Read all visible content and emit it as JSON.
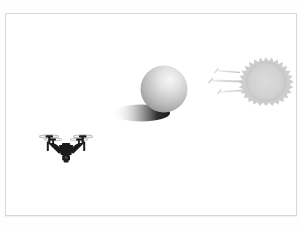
{
  "figure": {
    "title": "",
    "background_color": "#ffffff",
    "frame_color": "#d8d8d8",
    "width": 302,
    "height": 228
  },
  "scene": {
    "description": "Illustration of a quadcopter drone flying near a large sphere that casts a shadow, illuminated by a stylized sun emitting light rays from the right.",
    "objects": [
      {
        "name": "sun",
        "label": "sun",
        "shape": "spiked-circle",
        "color": "#d2d2d2",
        "edge_color": "#c6c6c6",
        "center_x": 266,
        "center_y": 79,
        "radius": 19,
        "spike_count": 22
      },
      {
        "name": "light-rays",
        "label": "light rays",
        "color": "#d0d0d0",
        "count": 3,
        "direction": "right-to-left",
        "rays": [
          {
            "x1": 236,
            "y1": 73,
            "x2": 214,
            "y2": 71
          },
          {
            "x1": 233,
            "y1": 82,
            "x2": 209,
            "y2": 81
          },
          {
            "x1": 237,
            "y1": 90,
            "x2": 217,
            "y2": 91
          }
        ]
      },
      {
        "name": "sphere",
        "label": "sphere",
        "shape": "circle",
        "center_x": 164,
        "center_y": 89,
        "radius": 23,
        "highlight_color": "#f2f2f2",
        "mid_color": "#bfbfbf",
        "shade_color": "#8e8e8e"
      },
      {
        "name": "sphere-shadow",
        "label": "cast shadow",
        "shape": "ellipse",
        "center_x": 140,
        "center_y": 113,
        "radius_x": 28,
        "radius_y": 8,
        "dark_color": "#1a1a1a",
        "light_color": "#ffffff"
      },
      {
        "name": "drone",
        "label": "quadcopter drone",
        "color": "#1c1c1c",
        "center_x": 66,
        "center_y": 148,
        "rotor_count": 4,
        "width": 54,
        "height": 38
      }
    ]
  }
}
